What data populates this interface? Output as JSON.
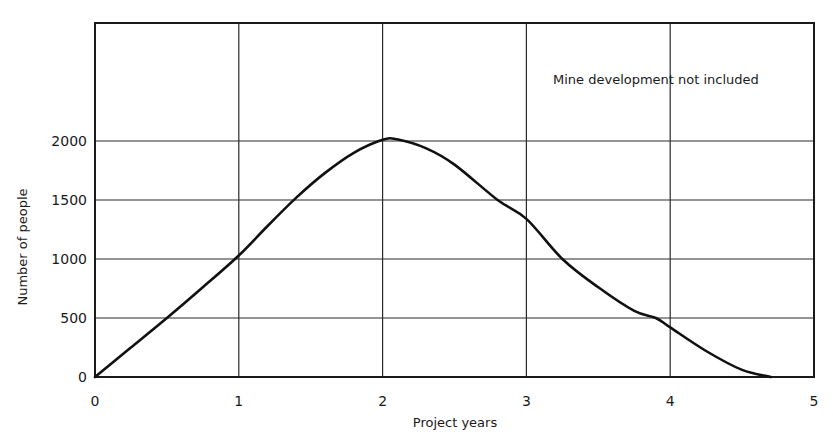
{
  "chart_data": {
    "type": "line",
    "title": "",
    "xlabel": "Project years",
    "ylabel": "Number of people",
    "xlim": [
      0,
      5
    ],
    "ylim": [
      0,
      3000
    ],
    "x_ticks": [
      0,
      1,
      2,
      3,
      4,
      5
    ],
    "y_ticks": [
      0,
      500,
      1000,
      1500,
      2000
    ],
    "grid": true,
    "legend": null,
    "annotations": [
      {
        "text": "Mine development not included",
        "x": 3.3,
        "y": 2700
      }
    ],
    "series": [
      {
        "name": "Number of people",
        "x": [
          0,
          0.25,
          0.5,
          0.75,
          1.0,
          1.2,
          1.4,
          1.6,
          1.8,
          2.0,
          2.1,
          2.3,
          2.5,
          2.8,
          3.0,
          3.25,
          3.5,
          3.75,
          3.9,
          4.0,
          4.25,
          4.5,
          4.7
        ],
        "y": [
          0,
          250,
          500,
          760,
          1030,
          1280,
          1520,
          1730,
          1900,
          2010,
          2015,
          1940,
          1800,
          1500,
          1340,
          1000,
          760,
          560,
          500,
          420,
          220,
          60,
          0
        ]
      }
    ]
  }
}
